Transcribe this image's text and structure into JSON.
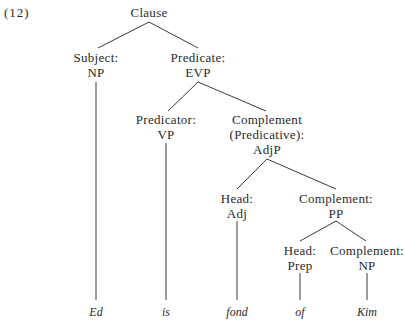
{
  "example_number": "(12)",
  "nodes": {
    "root": {
      "label": "Clause"
    },
    "subject": {
      "function": "Subject:",
      "category": "NP"
    },
    "predicate": {
      "function": "Predicate:",
      "category": "EVP"
    },
    "predicator": {
      "function": "Predicator:",
      "category": "VP"
    },
    "complement_pred": {
      "function": "Complement",
      "subfunction": "(Predicative):",
      "category": "AdjP"
    },
    "head_adj": {
      "function": "Head:",
      "category": "Adj"
    },
    "complement_pp": {
      "function": "Complement:",
      "category": "PP"
    },
    "head_prep": {
      "function": "Head:",
      "category": "Prep"
    },
    "complement_np": {
      "function": "Complement:",
      "category": "NP"
    }
  },
  "words": [
    "Ed",
    "is",
    "fond",
    "of",
    "Kim"
  ]
}
